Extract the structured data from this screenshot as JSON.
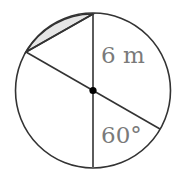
{
  "diagram": {
    "type": "circle-geometry",
    "labels": {
      "radius": "6 m",
      "angle": "60°"
    },
    "colors": {
      "stroke": "#333333",
      "shaded_segment": "#e6e6e6",
      "label": "#7a7a7a",
      "center_dot": "#000000"
    },
    "elements": {
      "circle": "circle of radius 6 m",
      "vertical_diameter": "vertical diameter through center",
      "slanted_diameter": "diameter at 60° to the vertical",
      "chord": "chord joining top of vertical diameter and upper-left end of slanted diameter",
      "shaded_segment": "circular segment cut off by the chord"
    }
  }
}
